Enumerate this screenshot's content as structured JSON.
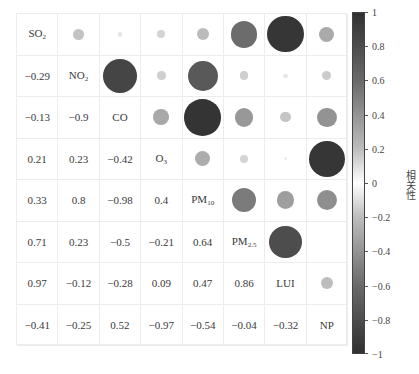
{
  "chart_data": {
    "type": "heatmap",
    "subtype": "correlation-matrix-circle",
    "title": "",
    "variables": [
      "SO2",
      "NO2",
      "CO",
      "O3",
      "PM10",
      "PM2.5",
      "LUI",
      "NP"
    ],
    "variable_labels": [
      {
        "base": "SO",
        "sub": "2"
      },
      {
        "base": "NO",
        "sub": "2"
      },
      {
        "base": "CO",
        "sub": ""
      },
      {
        "base": "O",
        "sub": "3"
      },
      {
        "base": "PM",
        "sub": "10"
      },
      {
        "base": "PM",
        "sub": "2.5"
      },
      {
        "base": "LUI",
        "sub": ""
      },
      {
        "base": "NP",
        "sub": ""
      }
    ],
    "matrix": [
      [
        1,
        -0.29,
        -0.13,
        0.21,
        0.33,
        0.71,
        0.97,
        -0.41
      ],
      [
        -0.29,
        1,
        -0.9,
        0.23,
        0.8,
        0.23,
        -0.12,
        -0.25
      ],
      [
        -0.13,
        -0.9,
        1,
        -0.42,
        -0.98,
        -0.5,
        -0.28,
        0.52
      ],
      [
        0.21,
        0.23,
        -0.42,
        1,
        0.4,
        -0.21,
        0.09,
        -0.97
      ],
      [
        0.33,
        0.8,
        -0.98,
        0.4,
        1,
        0.64,
        0.47,
        -0.54
      ],
      [
        0.71,
        0.23,
        -0.5,
        -0.21,
        0.64,
        1,
        0.86,
        -0.04
      ],
      [
        0.97,
        -0.12,
        -0.28,
        0.09,
        0.47,
        0.86,
        1,
        -0.32
      ],
      [
        -0.41,
        -0.25,
        0.52,
        -0.97,
        -0.54,
        -0.04,
        -0.32,
        1
      ]
    ],
    "lower_triangle_labels": [
      [
        "-0.29"
      ],
      [
        "-0.13",
        "-0.9"
      ],
      [
        "0.21",
        "0.23",
        "-0.42"
      ],
      [
        "0.33",
        "0.8",
        "-0.98",
        "0.4"
      ],
      [
        "0.71",
        "0.23",
        "-0.5",
        "-0.21",
        "0.64"
      ],
      [
        "0.97",
        "-0.12",
        "-0.28",
        "0.09",
        "0.47",
        "0.86"
      ],
      [
        "-0.41",
        "-0.25",
        "0.52",
        "-0.97",
        "-0.54",
        "-0.04",
        "-0.32"
      ]
    ],
    "upper_triangle": "circles sized and shaded by |r|",
    "diagonal": "variable names",
    "colorbar": {
      "label": "相关性",
      "range": [
        -1,
        1
      ],
      "ticks": [
        1,
        0.8,
        0.6,
        0.4,
        0.2,
        0,
        -0.2,
        -0.4,
        -0.6,
        -0.8,
        -1
      ],
      "tick_labels": [
        "1",
        "0.8",
        "0.6",
        "0.4",
        "0.2",
        "0",
        "−0.2",
        "−0.4",
        "−0.6",
        "−0.8",
        "−1"
      ],
      "colormap": "grayscale symmetric: white at 0, dark gray at ±1",
      "position": "right"
    },
    "grid": true
  },
  "colors": {
    "dark": "#303030",
    "mid": "#6a6a6a",
    "light": "#bdbdbd",
    "zero": "#ffffff",
    "grid_line": "#ececec"
  }
}
